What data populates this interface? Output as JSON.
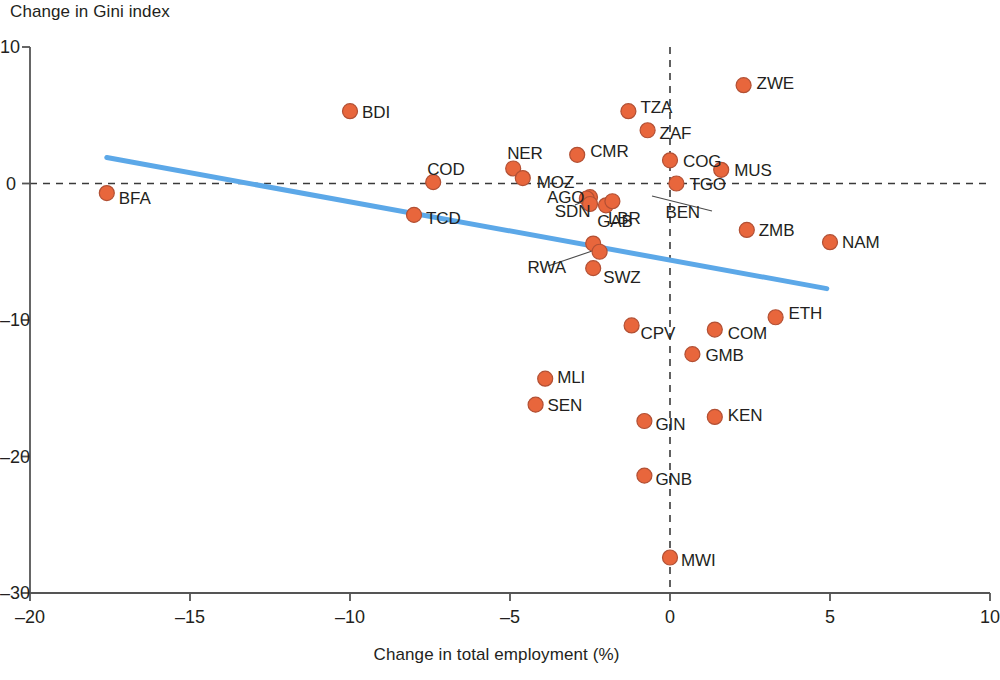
{
  "chart_data": {
    "type": "scatter",
    "title": "",
    "xlabel": "Change in total employment (%)",
    "ylabel": "Change in Gini index",
    "xlim": [
      -20,
      10
    ],
    "ylim": [
      -30,
      10
    ],
    "xticks": [
      -20,
      -15,
      -10,
      -5,
      0,
      5,
      10
    ],
    "xticklabels": [
      "–20",
      "–15",
      "–10",
      "–5",
      "0",
      "5",
      "10"
    ],
    "yticks": [
      -30,
      -20,
      -10,
      0,
      10
    ],
    "yticklabels": [
      "–30",
      "–20",
      "–10",
      "0",
      "10"
    ],
    "grid": false,
    "legend": null,
    "reference_lines": [
      {
        "name": "zero-gini-line",
        "orientation": "horizontal",
        "value": 0,
        "style": "dashed"
      },
      {
        "name": "zero-employment-line",
        "orientation": "vertical",
        "value": 0,
        "style": "dashed"
      }
    ],
    "trendline": {
      "name": "linear-fit",
      "x0": -17.6,
      "y0": 1.9,
      "x1": 4.9,
      "y1": -7.7,
      "color": "#5CA8E8"
    },
    "marker_color": "#E8663C",
    "marker_edge_color": "#B25034",
    "points": [
      {
        "code": "BFA",
        "x": -17.6,
        "y": -0.7,
        "lx": 12,
        "ly": 8
      },
      {
        "code": "BDI",
        "x": -10.0,
        "y": 5.3,
        "lx": 12,
        "ly": 4
      },
      {
        "code": "COD",
        "x": -7.4,
        "y": 0.1,
        "lx": -6,
        "ly": -10
      },
      {
        "code": "TCD",
        "x": -8.0,
        "y": -2.3,
        "lx": 12,
        "ly": 6
      },
      {
        "code": "NER",
        "x": -4.9,
        "y": 1.1,
        "lx": -6,
        "ly": -12
      },
      {
        "code": "MOZ",
        "x": -4.6,
        "y": 0.4,
        "lx": 14,
        "ly": 7
      },
      {
        "code": "CMR",
        "x": -2.9,
        "y": 2.1,
        "lx": 13,
        "ly": -1
      },
      {
        "code": "TZA",
        "x": -1.3,
        "y": 5.3,
        "lx": 12,
        "ly": -1
      },
      {
        "code": "ZAF",
        "x": -0.7,
        "y": 3.9,
        "lx": 12,
        "ly": 6
      },
      {
        "code": "ZWE",
        "x": 2.3,
        "y": 7.2,
        "lx": 13,
        "ly": 1
      },
      {
        "code": "COG",
        "x": 0.0,
        "y": 1.7,
        "lx": 13,
        "ly": 4
      },
      {
        "code": "MUS",
        "x": 1.6,
        "y": 1.0,
        "lx": 13,
        "ly": 3
      },
      {
        "code": "AGO",
        "x": -2.5,
        "y": -1.0,
        "lx": -43,
        "ly": 3
      },
      {
        "code": "TGO",
        "x": 0.2,
        "y": 0.0,
        "lx": 13,
        "ly": 3
      },
      {
        "code": "SDN",
        "x": -2.6,
        "y": -1.1,
        "lx": -32,
        "ly": 15
      },
      {
        "code": "SDN2",
        "x": -2.5,
        "y": -1.5,
        "lx": null,
        "ly": null
      },
      {
        "code": "LBR",
        "x": -2.0,
        "y": -1.6,
        "lx": 2,
        "ly": 16
      },
      {
        "code": "BEN",
        "x": -1.8,
        "y": -1.3,
        "lx": 53,
        "ly": 14
      },
      {
        "code": "ZMB",
        "x": 2.4,
        "y": -3.4,
        "lx": 12,
        "ly": 3
      },
      {
        "code": "NAM",
        "x": 5.0,
        "y": -4.3,
        "lx": 12,
        "ly": 3
      },
      {
        "code": "GAB",
        "x": -2.4,
        "y": -4.4,
        "lx": 4,
        "ly": -20
      },
      {
        "code": "RWA",
        "x": -2.2,
        "y": -5.0,
        "lx": -72,
        "ly": 18
      },
      {
        "code": "SWZ",
        "x": -2.4,
        "y": -6.2,
        "lx": 10,
        "ly": 12
      },
      {
        "code": "ETH",
        "x": 3.3,
        "y": -9.8,
        "lx": 13,
        "ly": -1
      },
      {
        "code": "CPV",
        "x": -1.2,
        "y": -10.4,
        "lx": 9,
        "ly": 11
      },
      {
        "code": "COM",
        "x": 1.4,
        "y": -10.7,
        "lx": 13,
        "ly": 6
      },
      {
        "code": "GMB",
        "x": 0.7,
        "y": -12.5,
        "lx": 13,
        "ly": 4
      },
      {
        "code": "MLI",
        "x": -3.9,
        "y": -14.3,
        "lx": 12,
        "ly": 1
      },
      {
        "code": "SEN",
        "x": -4.2,
        "y": -16.2,
        "lx": 12,
        "ly": 3
      },
      {
        "code": "KEN",
        "x": 1.4,
        "y": -17.1,
        "lx": 13,
        "ly": 1
      },
      {
        "code": "GIN",
        "x": -0.8,
        "y": -17.4,
        "lx": 11,
        "ly": 6
      },
      {
        "code": "GNB",
        "x": -0.8,
        "y": -21.4,
        "lx": 11,
        "ly": 6
      },
      {
        "code": "MWI",
        "x": 0.0,
        "y": -27.4,
        "lx": 11,
        "ly": 5
      }
    ]
  },
  "axes": {
    "y_title": "Change in Gini index",
    "x_title": "Change in total employment (%)"
  }
}
